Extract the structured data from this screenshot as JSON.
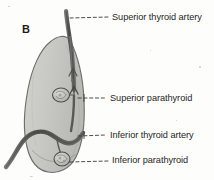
{
  "figure": {
    "panel_letter": "B",
    "background_color": "#fdfdfc",
    "ink_color": "#262626",
    "gland_fill_color": "#c8c8c4",
    "gland_outline_color": "#6f6f6c",
    "artery_color": "#5d5d5a",
    "leader_line_color": "#3a3a3a"
  },
  "labels": {
    "superior_thyroid_artery": "Superior thyroid artery",
    "superior_parathyroid": "Superior parathyroid",
    "inferior_thyroid_artery": "Inferior thyroid artery",
    "inferior_parathyroid": "Inferior parathyroid"
  },
  "structures": [
    {
      "name": "thyroid-lobe",
      "label": "Thyroid lobe",
      "description": "Large elongated ovoid lobe occupying the left half of the panel, shaded light gray with a darker outline"
    },
    {
      "name": "superior-thyroid-artery",
      "label": "Superior thyroid artery",
      "description": "Dark vessel descending from the top of the panel into the upper pole of the lobe, branching into the gland"
    },
    {
      "name": "superior-parathyroid",
      "label": "Superior parathyroid",
      "description": "Small oval gland on the upper-middle posterior surface of the lobe"
    },
    {
      "name": "inferior-thyroid-artery",
      "label": "Inferior thyroid artery",
      "description": "Curved S-shaped vessel entering from the lower left and passing behind the lower pole of the lobe"
    },
    {
      "name": "inferior-parathyroid",
      "label": "Inferior parathyroid",
      "description": "Small oval gland near the lower pole of the lobe"
    }
  ]
}
